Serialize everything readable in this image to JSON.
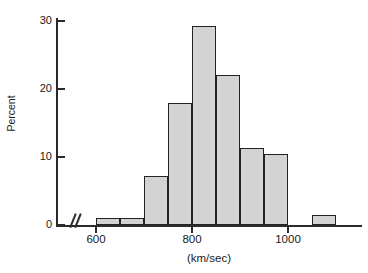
{
  "chart_data": {
    "type": "bar",
    "title": "",
    "subtitle": "",
    "xlabel": "(km/sec)",
    "ylabel": "Percent",
    "grid": false,
    "legend": null,
    "axis_break": true,
    "axis_break_symbol": "//",
    "xlim": [
      560,
      1140
    ],
    "ylim": [
      0,
      31
    ],
    "x_ticks": [
      {
        "label": "600",
        "value": 600
      },
      {
        "label": "800",
        "value": 800
      },
      {
        "label": "1000",
        "value": 1000
      }
    ],
    "y_ticks": [
      {
        "label": "0",
        "value": 0
      },
      {
        "label": "10",
        "value": 10
      },
      {
        "label": "20",
        "value": 20
      },
      {
        "label": "30",
        "value": 30
      }
    ],
    "bin_width": 50,
    "categories": [
      "600-650",
      "650-700",
      "700-750",
      "750-800",
      "800-850",
      "850-900",
      "900-950",
      "950-1000",
      "1050-1100"
    ],
    "bins": [
      {
        "start": 600,
        "end": 650,
        "value": 1.0
      },
      {
        "start": 650,
        "end": 700,
        "value": 1.0
      },
      {
        "start": 700,
        "end": 750,
        "value": 7.2
      },
      {
        "start": 750,
        "end": 800,
        "value": 18.0
      },
      {
        "start": 800,
        "end": 850,
        "value": 29.2
      },
      {
        "start": 850,
        "end": 900,
        "value": 22.1
      },
      {
        "start": 900,
        "end": 950,
        "value": 11.3
      },
      {
        "start": 950,
        "end": 1000,
        "value": 10.4
      },
      {
        "start": 1050,
        "end": 1100,
        "value": 1.4
      }
    ],
    "values": [
      1.0,
      1.0,
      7.2,
      18.0,
      29.2,
      22.1,
      11.3,
      10.4,
      1.4
    ],
    "colors": {
      "bar_fill": "#d3d3d3",
      "bar_edge": "#232323",
      "axis": "#2b2b2b",
      "text": "#1a1a1a",
      "background": "#ffffff"
    }
  }
}
